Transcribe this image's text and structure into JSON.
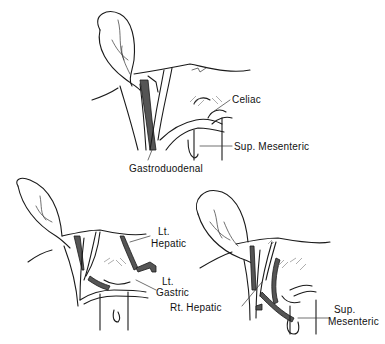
{
  "figure": {
    "panels": [
      {
        "id": "top",
        "labels": {
          "celiac": "Celiac",
          "sup_mesenteric": "Sup. Mesenteric",
          "gastroduodenal": "Gastroduodenal"
        }
      },
      {
        "id": "bottom-left",
        "labels": {
          "lt_hepatic_line1": "Lt.",
          "lt_hepatic_line2": "Hepatic",
          "lt_gastric_line1": "Lt.",
          "lt_gastric_line2": "Gastric"
        }
      },
      {
        "id": "bottom-right",
        "labels": {
          "rt_hepatic": "Rt. Hepatic",
          "sup_mesenteric_line1": "Sup.",
          "sup_mesenteric_line2": "Mesenteric"
        }
      }
    ]
  }
}
